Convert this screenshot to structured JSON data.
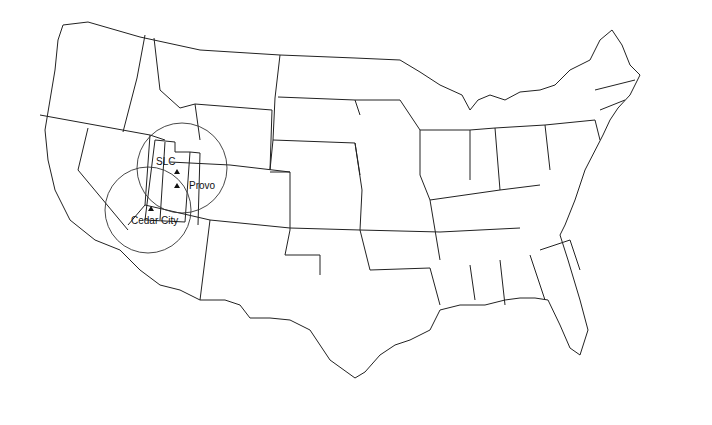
{
  "map": {
    "title": "",
    "region": "Contiguous United States",
    "sites": [
      {
        "name": "SLC",
        "symbol": "triangle"
      },
      {
        "name": "Provo",
        "symbol": "triangle"
      },
      {
        "name": "Cedar City",
        "symbol": "triangle"
      }
    ],
    "coverage_circles": 2,
    "colors": {
      "line": "#222222",
      "background": "#ffffff"
    }
  }
}
